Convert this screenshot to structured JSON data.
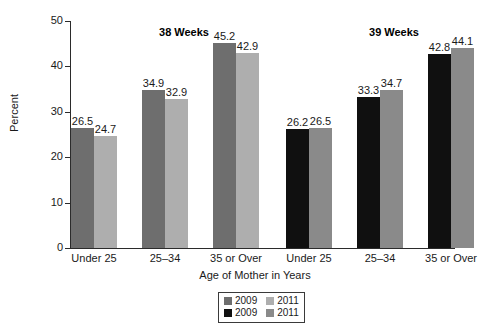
{
  "chart_data": {
    "type": "bar",
    "title": "",
    "xlabel": "Age of Mother in Years",
    "ylabel": "Percent",
    "ylim": [
      0,
      50
    ],
    "yticks": [
      "0",
      "10",
      "20",
      "30",
      "40",
      "50"
    ],
    "grid": false,
    "legend_position": "bottom-center",
    "panels": [
      {
        "title": "38 Weeks",
        "categories": [
          "Under 25",
          "25–34",
          "35 or Over"
        ],
        "series": [
          {
            "name": "2009",
            "color": "#6e6e6e",
            "values": [
              26.5,
              34.9,
              45.2
            ]
          },
          {
            "name": "2011",
            "color": "#aeaeae",
            "values": [
              24.7,
              32.9,
              42.9
            ]
          }
        ]
      },
      {
        "title": "39 Weeks",
        "categories": [
          "Under 25",
          "25–34",
          "35 or Over"
        ],
        "series": [
          {
            "name": "2009",
            "color": "#101010",
            "values": [
              26.2,
              33.3,
              42.8
            ]
          },
          {
            "name": "2011",
            "color": "#8a8a8a",
            "values": [
              26.5,
              34.7,
              44.1
            ]
          }
        ]
      }
    ],
    "legend": [
      {
        "row": 1,
        "entries": [
          {
            "label": "2009",
            "color": "#6e6e6e"
          },
          {
            "label": "2011",
            "color": "#aeaeae"
          }
        ]
      },
      {
        "row": 2,
        "entries": [
          {
            "label": "2009",
            "color": "#101010"
          },
          {
            "label": "2011",
            "color": "#8a8a8a"
          }
        ]
      }
    ]
  }
}
